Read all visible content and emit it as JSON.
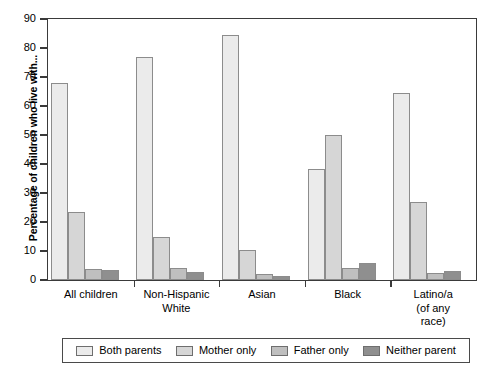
{
  "chart_data": {
    "type": "bar",
    "title": "",
    "xlabel": "",
    "ylabel": "Percentage of children who live with...",
    "ylim": [
      0,
      90
    ],
    "yticks": [
      0,
      10,
      20,
      30,
      40,
      50,
      60,
      70,
      80,
      90
    ],
    "grid": false,
    "legend_position": "bottom",
    "categories": [
      "All children",
      "Non-Hispanic\nWhite",
      "Asian",
      "Black",
      "Latino/a\n(of any\nrace)"
    ],
    "category_lines": [
      [
        "All children"
      ],
      [
        "Non-Hispanic",
        "White"
      ],
      [
        "Asian"
      ],
      [
        "Black"
      ],
      [
        "Latino/a",
        "(of any",
        "race)"
      ]
    ],
    "series": [
      {
        "name": "Both parents",
        "color": "#ebebeb",
        "values": [
          68.0,
          77.0,
          84.5,
          38.2,
          64.5
        ]
      },
      {
        "name": "Mother only",
        "color": "#d6d6d6",
        "values": [
          23.4,
          14.8,
          10.3,
          50.0,
          27.0
        ]
      },
      {
        "name": "Father only",
        "color": "#bfbfbf",
        "values": [
          3.8,
          4.0,
          2.2,
          4.2,
          2.5
        ]
      },
      {
        "name": "Neither parent",
        "color": "#8f8f8f",
        "values": [
          3.5,
          2.7,
          1.3,
          5.8,
          3.2
        ]
      }
    ]
  },
  "legend": {
    "items": [
      {
        "label": "Both parents",
        "color": "#ebebeb"
      },
      {
        "label": "Mother only",
        "color": "#d6d6d6"
      },
      {
        "label": "Father only",
        "color": "#bfbfbf"
      },
      {
        "label": "Neither parent",
        "color": "#8f8f8f"
      }
    ]
  },
  "axis": {
    "y_title": "Percentage of children who live with...",
    "y_tick_labels": [
      "0",
      "10",
      "20",
      "30",
      "40",
      "50",
      "60",
      "70",
      "80",
      "90"
    ]
  }
}
